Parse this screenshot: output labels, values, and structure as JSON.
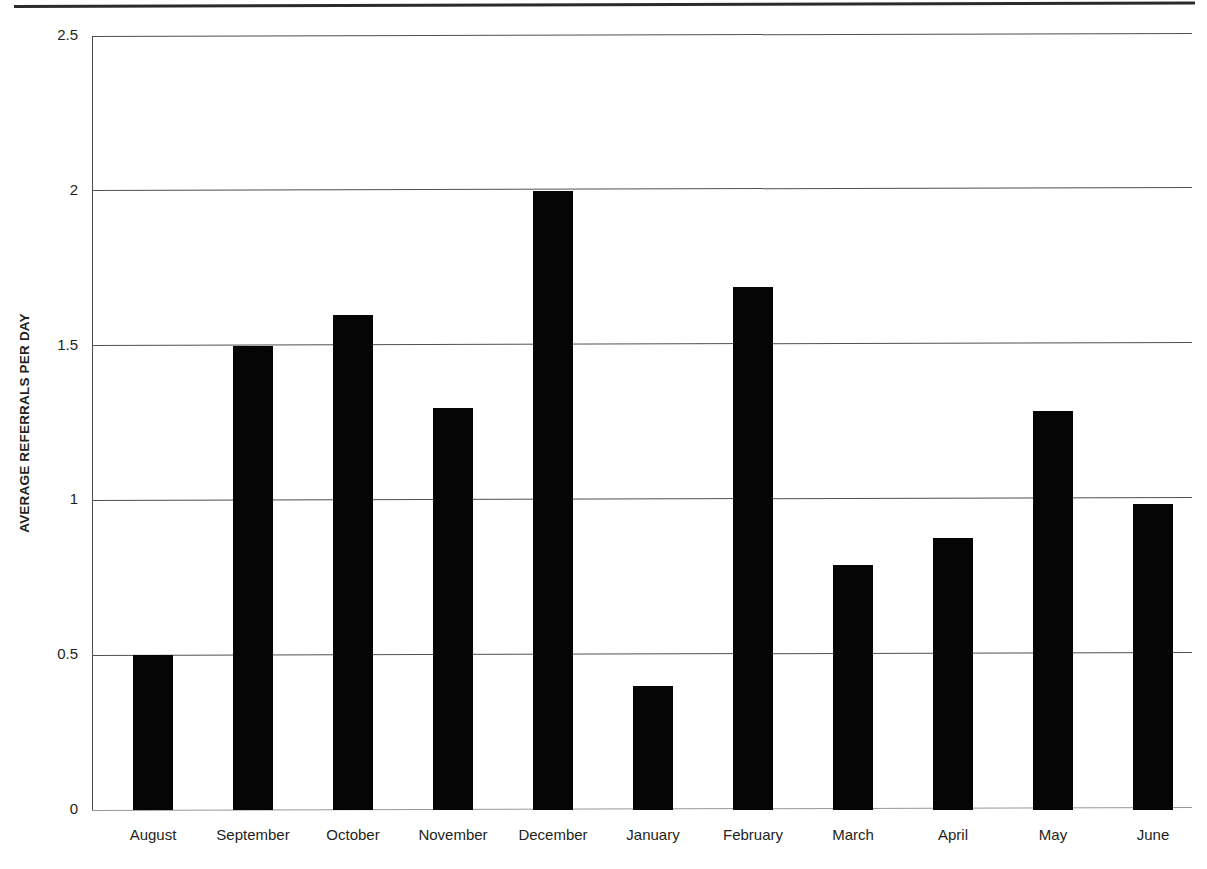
{
  "chart_data": {
    "type": "bar",
    "title": "",
    "subtitle": "",
    "xlabel": "",
    "ylabel": "AVERAGE REFERRALS PER DAY",
    "categories": [
      "August",
      "September",
      "October",
      "November",
      "December",
      "January",
      "February",
      "March",
      "April",
      "May",
      "June"
    ],
    "values": [
      0.5,
      1.5,
      1.6,
      1.3,
      2.0,
      0.4,
      1.69,
      0.79,
      0.88,
      1.29,
      0.99
    ],
    "series": [
      {
        "name": "Average referrals per day",
        "values": [
          0.5,
          1.5,
          1.6,
          1.3,
          2.0,
          0.4,
          1.69,
          0.79,
          0.88,
          1.29,
          0.99
        ]
      }
    ],
    "ylim": [
      0,
      2.5
    ],
    "y_ticks": [
      0,
      0.5,
      1,
      1.5,
      2,
      2.5
    ],
    "y_tick_labels": [
      "0",
      "0.5",
      "1",
      "1.5",
      "2",
      "2.5"
    ],
    "grid": true,
    "grid_axis": "y",
    "legend": false,
    "legend_position": "none",
    "bar_color": "#050505",
    "gridline_color": "#54514f",
    "axis_color": "#4a4a4a",
    "background_color": "#ffffff",
    "text_color": "#231f20",
    "annotations": []
  }
}
